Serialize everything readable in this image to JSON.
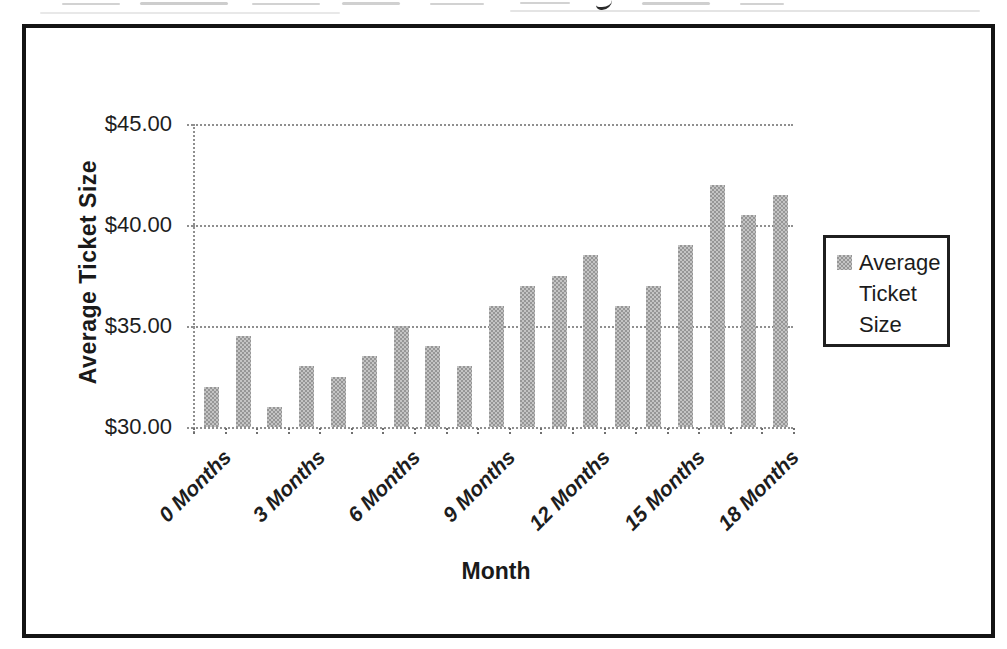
{
  "chart_data": {
    "type": "bar",
    "title": "",
    "xlabel": "Month",
    "ylabel": "Average Ticket Size",
    "ylim": [
      30,
      45
    ],
    "y_tick_step": 5,
    "y_tick_labels": [
      {
        "value": 30,
        "label": "$30.00"
      },
      {
        "value": 35,
        "label": "$35.00"
      },
      {
        "value": 40,
        "label": "$40.00"
      },
      {
        "value": 45,
        "label": "$45.00"
      }
    ],
    "categories_months": [
      0,
      1,
      2,
      3,
      4,
      5,
      6,
      7,
      8,
      9,
      10,
      11,
      12,
      13,
      14,
      15,
      16,
      17,
      18
    ],
    "values": [
      32.0,
      34.5,
      31.0,
      33.0,
      32.5,
      33.5,
      35.0,
      34.0,
      33.0,
      36.0,
      37.0,
      37.5,
      38.5,
      36.0,
      37.0,
      39.0,
      42.0,
      40.5,
      41.5
    ],
    "x_tick_labels": [
      "0 Months",
      "3 Months",
      "6 Months",
      "9 Months",
      "12 Months",
      "15 Months",
      "18 Months"
    ],
    "x_label_every": 3,
    "legend": {
      "label": "Average Ticket Size",
      "position": "right"
    },
    "grid": "horizontal-dotted",
    "bar_color": "#a9a9a9",
    "gridline_color": "#8f8f8f",
    "text_color": "#1d1d1d",
    "frame_color": "#141414"
  }
}
